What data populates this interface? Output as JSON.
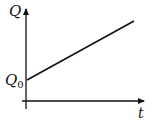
{
  "chart_data": {
    "type": "line",
    "title": "",
    "xlabel": "t",
    "ylabel": "Q",
    "y_intercept_label": "Q0",
    "y_intercept_label_main": "Q",
    "y_intercept_label_sub": "0",
    "grid": false,
    "legend": null,
    "ticks": {
      "x": [],
      "y": [
        "Q0"
      ]
    },
    "series": [
      {
        "name": "Q(t)",
        "description": "straight line with positive slope starting at Q0 on the Q-axis",
        "x": [
          0,
          1
        ],
        "y": [
          "Q0",
          "Q0 + k"
        ]
      }
    ],
    "colors": {
      "line": "#111111",
      "axes": "#111111",
      "background": "#ffffff"
    },
    "pixel_geometry": {
      "y_axis": {
        "x": 26,
        "y_top": 8,
        "y_bottom": 109
      },
      "x_axis": {
        "y": 101,
        "x_left": 22,
        "x_right": 145
      },
      "line": {
        "x1": 27,
        "y1": 80,
        "x2": 134,
        "y2": 21
      }
    }
  },
  "labels": {
    "y_axis": "Q",
    "x_axis": "t",
    "intercept_main": "Q",
    "intercept_sub": "0"
  }
}
